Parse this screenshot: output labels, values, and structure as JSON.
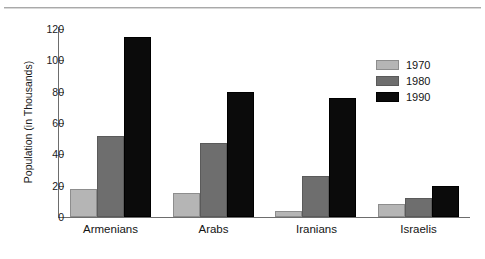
{
  "chart_data": {
    "type": "bar",
    "title": "",
    "xlabel": "",
    "ylabel": "Population (in Thousands)",
    "categories": [
      "Armenians",
      "Arabs",
      "Iranians",
      "Israelis"
    ],
    "series": [
      {
        "name": "1970",
        "color": "#b5b5b5",
        "values": [
          18,
          15,
          4,
          8
        ]
      },
      {
        "name": "1980",
        "color": "#6e6e6e",
        "values": [
          52,
          47,
          26,
          12
        ]
      },
      {
        "name": "1990",
        "color": "#0b0b0b",
        "values": [
          115,
          80,
          76,
          20
        ]
      }
    ],
    "ylim": [
      0,
      120
    ],
    "yticks": [
      0,
      20,
      40,
      60,
      80,
      100,
      120
    ],
    "ytick_labels": [
      "0",
      "20",
      "40",
      "60",
      "80",
      "100",
      "120"
    ],
    "grid": false,
    "legend_position": "upper right",
    "legend_entries": [
      "1970",
      "1980",
      "1990"
    ]
  },
  "figure": {
    "top_rule_color": "#a9a9a9",
    "background": "#ffffff"
  }
}
